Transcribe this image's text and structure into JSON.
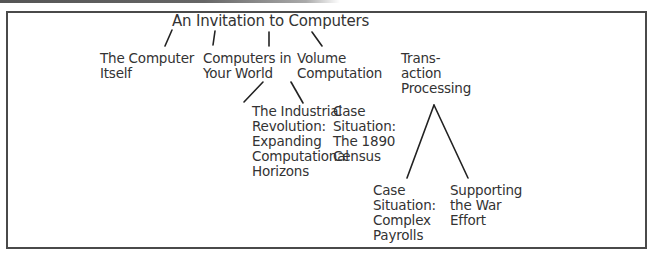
{
  "diagram": {
    "root": {
      "label": "An Invitation to Computers"
    },
    "level1": [
      {
        "id": "computer-itself",
        "label": "The Computer\nItself"
      },
      {
        "id": "computers-in-world",
        "label": "Computers in\nYour World"
      },
      {
        "id": "volume-computation",
        "label": "Volume\nComputation"
      },
      {
        "id": "transaction-processing",
        "label": "Trans-\naction\nProcessing"
      }
    ],
    "level2": [
      {
        "id": "industrial-revolution",
        "parent": "volume-computation",
        "label": "The Industrial\nRevolution:\nExpanding\nComputational\nHorizons"
      },
      {
        "id": "census-1890",
        "parent": "volume-computation",
        "label": "Case\nSituation:\nThe 1890\nCensus"
      },
      {
        "id": "complex-payrolls",
        "parent": "transaction-processing",
        "label": "Case\nSituation:\nComplex\nPayrolls"
      },
      {
        "id": "war-effort",
        "parent": "transaction-processing",
        "label": "Supporting\nthe War\nEffort"
      }
    ]
  }
}
